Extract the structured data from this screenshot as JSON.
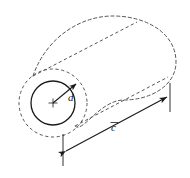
{
  "figure": {
    "background_color": "#ffffff",
    "line_color": "#1a1a1a",
    "dashed_color": "#555555"
  },
  "labels": {
    "diameter": "d",
    "length": "c",
    "length_has_overbar": true
  },
  "geometry": {
    "near_face": {
      "outer_circle": {
        "cx": 53,
        "cy": 103,
        "r": 34,
        "style": "dashed"
      },
      "inner_circle": {
        "cx": 53,
        "cy": 103,
        "r": 22,
        "style": "solid"
      },
      "center_mark": {
        "cx": 53,
        "cy": 103,
        "size": 4
      }
    },
    "far_face": {
      "style": "dashed",
      "description": "dashed elliptical cylinder end at upper right"
    },
    "body_lines": [
      {
        "x1": 33,
        "y1": 76,
        "x2": 137,
        "y2": 22,
        "style": "dashed"
      },
      {
        "x1": 75,
        "y1": 126,
        "x2": 168,
        "y2": 77,
        "style": "dashed"
      }
    ],
    "diameter_arrow": {
      "x1": 53,
      "y1": 103,
      "x2": 78,
      "y2": 82
    },
    "length_dimension": {
      "x1": 63,
      "y1": 150,
      "x2": 170,
      "y2": 95,
      "extension_left": {
        "x": 63,
        "y1": 133,
        "y2": 166
      },
      "extension_right": {
        "x": 170,
        "y1": 82,
        "y2": 112
      }
    }
  },
  "label_positions": {
    "diameter": {
      "x": 68,
      "y": 101
    },
    "length": {
      "x": 112,
      "y": 130
    }
  }
}
